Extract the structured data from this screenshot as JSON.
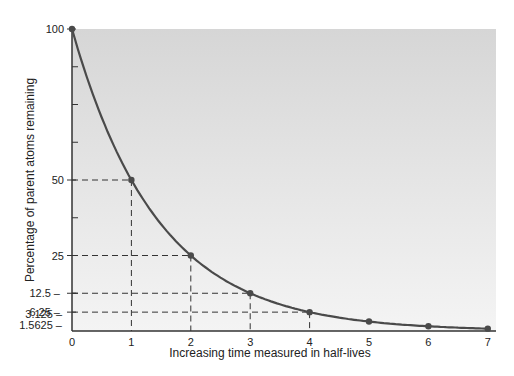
{
  "chart_data": {
    "type": "line",
    "title": "",
    "xlabel": "Increasing time measured in half-lives",
    "ylabel": "Percentage of parent atoms remaining",
    "x": [
      0,
      1,
      2,
      3,
      4,
      5,
      6,
      7
    ],
    "series": [
      {
        "name": "Parent atoms remaining",
        "values": [
          100,
          50,
          25,
          12.5,
          6.25,
          3.125,
          1.5625,
          0.78125
        ]
      }
    ],
    "x_ticks": [
      "0",
      "1",
      "2",
      "3",
      "4",
      "5",
      "6",
      "7"
    ],
    "y_tick_labels": [
      "100",
      "50",
      "25",
      "12.5",
      "6.25",
      "3.125",
      "1.5625"
    ],
    "y_minor_ticks": [
      12.5,
      37.5,
      62.5,
      75,
      87.5
    ],
    "xlim": [
      0,
      7
    ],
    "ylim": [
      0,
      100
    ],
    "grid": false,
    "guide_lines": [
      {
        "x": 1,
        "y": 50
      },
      {
        "x": 2,
        "y": 25
      },
      {
        "x": 3,
        "y": 12.5
      },
      {
        "x": 4,
        "y": 6.25
      }
    ],
    "colors": {
      "curve": "#4a4a4a",
      "plot_bg_top": "#d6d6d6",
      "plot_bg_bottom": "#f4f4f4"
    }
  }
}
